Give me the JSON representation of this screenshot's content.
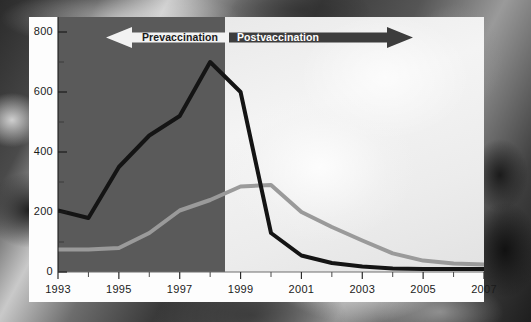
{
  "figure": {
    "background_description": "ct-scan-photograph-backdrop",
    "panel_color": "#fdfdfd",
    "prevaccination_overlay_color": "#5a5a5a",
    "postvaccination_overlay_color": "#eeeeee"
  },
  "annotations": {
    "pre": {
      "label": "Prevaccination",
      "direction": "left",
      "text_color": "#1a1a1a",
      "arrow_color": "#f2f2f2"
    },
    "post": {
      "label": "Postvaccination",
      "direction": "right",
      "text_color": "#ffffff",
      "arrow_color": "#3d3d3d"
    }
  },
  "chart_data": {
    "type": "line",
    "title": "",
    "subtitle": "",
    "xlabel": "",
    "ylabel": "",
    "xlim": [
      1993,
      2007
    ],
    "ylim": [
      0,
      850
    ],
    "grid": false,
    "legend": "none",
    "x": [
      1993,
      1994,
      1995,
      1996,
      1997,
      1998,
      1999,
      2000,
      2001,
      2002,
      2003,
      2004,
      2005,
      2006,
      2007
    ],
    "x_tick_labels": [
      "1993",
      "1995",
      "1997",
      "1999",
      "2001",
      "2003",
      "2005",
      "2007"
    ],
    "x_major_ticks": [
      1993,
      1995,
      1997,
      1999,
      2001,
      2003,
      2005,
      2007
    ],
    "x_minor_ticks": [
      1994,
      1996,
      1998,
      2000,
      2002,
      2004,
      2006
    ],
    "y_tick_labels": [
      "0",
      "200",
      "400",
      "600",
      "800"
    ],
    "y_major_ticks": [
      0,
      200,
      400,
      600,
      800
    ],
    "y_minor_ticks": [
      100,
      300,
      500,
      700
    ],
    "series": [
      {
        "name": "dark-series",
        "color": "#141414",
        "width": 4,
        "values": [
          205,
          180,
          350,
          455,
          520,
          700,
          600,
          130,
          55,
          30,
          18,
          12,
          10,
          10,
          10
        ]
      },
      {
        "name": "gray-series",
        "color": "#9a9a9a",
        "width": 4,
        "values": [
          75,
          75,
          80,
          130,
          205,
          240,
          285,
          290,
          200,
          150,
          105,
          62,
          38,
          28,
          25
        ]
      }
    ],
    "event_marker_year": 1998.5
  }
}
